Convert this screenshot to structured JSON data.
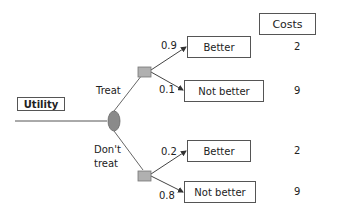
{
  "title_box": "Utility",
  "costs_header": "Costs",
  "branches": {
    "treat": "Treat",
    "dont_treat_line1": "Don't",
    "dont_treat_line2": "treat"
  },
  "outcomes": [
    {
      "probability": "0.9",
      "label": "Better",
      "cost": "2"
    },
    {
      "probability": "0.1",
      "label": "Not better",
      "cost": "9"
    },
    {
      "probability": "0.2",
      "label": "Better",
      "cost": "2"
    },
    {
      "probability": "0.8",
      "label": "Not better",
      "cost": "9"
    }
  ],
  "colors": {
    "node_fill": "#a8a8a8",
    "decision_fill": "#8a8a8a",
    "line": "#555555"
  }
}
